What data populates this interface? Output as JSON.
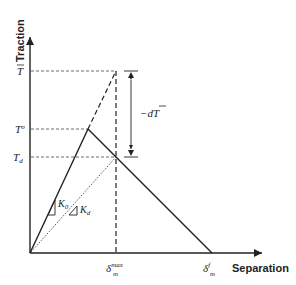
{
  "diagram": {
    "type": "bilinear traction-separation law",
    "axes": {
      "x_label": "Separation",
      "y_label": "Traction"
    },
    "y_ticks": {
      "t_bar": "T",
      "t_zero": "T",
      "t_zero_sup": "o",
      "t_d": "T",
      "t_d_sub": "d"
    },
    "x_ticks": {
      "delta_max": "δ",
      "delta_max_sup": "max",
      "delta_max_sub": "m",
      "delta_f": "δ",
      "delta_f_sup": "f",
      "delta_f_sub": "m"
    },
    "annotations": {
      "stiffness_initial": "K",
      "stiffness_initial_sub": "0",
      "stiffness_damaged": "K",
      "stiffness_damaged_sub": "d",
      "traction_drop": "−dT"
    },
    "colors": {
      "line": "#222222",
      "axis": "#222222",
      "background": "#ffffff"
    }
  }
}
